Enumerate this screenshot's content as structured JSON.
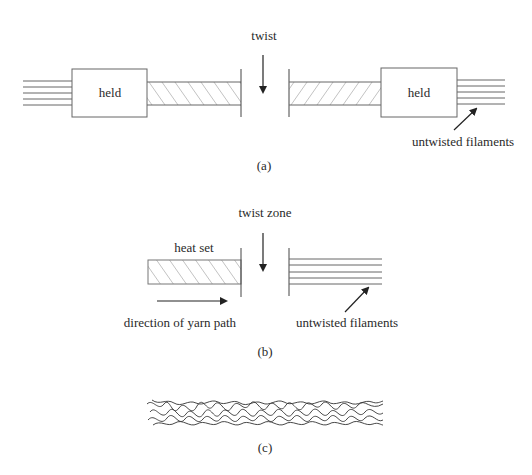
{
  "panel_a": {
    "caption": "(a)",
    "twist_label": "twist",
    "left_held_label": "held",
    "right_held_label": "held",
    "filaments_label": "untwisted filaments"
  },
  "panel_b": {
    "caption": "(b)",
    "twist_zone_label": "twist zone",
    "heat_set_label": "heat set",
    "direction_label": "direction of yarn path",
    "filaments_label": "untwisted filaments"
  },
  "panel_c": {
    "caption": "(c)"
  },
  "colors": {
    "line": "#555555",
    "text": "#2a2a2a",
    "background": "#ffffff"
  }
}
